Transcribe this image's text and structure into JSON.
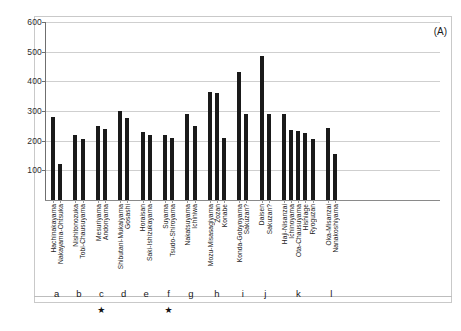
{
  "chart_data": {
    "type": "bar",
    "title": "",
    "panel_label": "(A)",
    "xlabel": "",
    "ylabel": "",
    "ylim": [
      0,
      600
    ],
    "yticks": [
      0,
      100,
      200,
      300,
      400,
      500,
      600
    ],
    "ytick_labels": [
      "",
      "100",
      "200",
      "300",
      "400",
      "500",
      "600"
    ],
    "grid": true,
    "legend": "none",
    "bar_color": "#1a1a1a",
    "categories": [
      "Hachinakayama",
      "Nakayama-Ohtsuka",
      "Nishitonozuka",
      "Tobi-Chausuyama",
      "Mesuriyama",
      "Andonyama",
      "Shibutani-Mukaiyama",
      "Gosashi",
      "Horaisan",
      "Saki-Ishizukayama",
      "Suyama",
      "Tsudo-Shiroyama",
      "Nakatsuyama",
      "Ichiniwa",
      "Mozu-Misasagiyama",
      "Zozan",
      "Konabe",
      "Konda-Gobyoyama",
      "Sakuzan?",
      "Daisen",
      "Sakuzan?",
      "Haji-Nisanzai",
      "Ichinoyama",
      "Ota-Chausuyama",
      "Hishiage",
      "Ryoguzan",
      "Oka-Misanzai",
      "Nanakoshiyama"
    ],
    "values": [
      280,
      120,
      218,
      207,
      250,
      240,
      300,
      275,
      228,
      218,
      220,
      209,
      290,
      250,
      365,
      362,
      210,
      430,
      290,
      487,
      290,
      290,
      235,
      232,
      227,
      207,
      243,
      155
    ],
    "groups": [
      {
        "letter": "a",
        "starred": false,
        "bars": 2
      },
      {
        "letter": "b",
        "starred": false,
        "bars": 2
      },
      {
        "letter": "c",
        "starred": true,
        "bars": 2
      },
      {
        "letter": "d",
        "starred": false,
        "bars": 2
      },
      {
        "letter": "e",
        "starred": false,
        "bars": 2
      },
      {
        "letter": "f",
        "starred": true,
        "bars": 2
      },
      {
        "letter": "g",
        "starred": false,
        "bars": 2
      },
      {
        "letter": "h",
        "starred": false,
        "bars": 3
      },
      {
        "letter": "i",
        "starred": false,
        "bars": 2
      },
      {
        "letter": "j",
        "starred": false,
        "bars": 2
      },
      {
        "letter": "k",
        "starred": false,
        "bars": 5
      },
      {
        "letter": "l",
        "starred": false,
        "bars": 2
      }
    ],
    "star_glyph": "★"
  }
}
